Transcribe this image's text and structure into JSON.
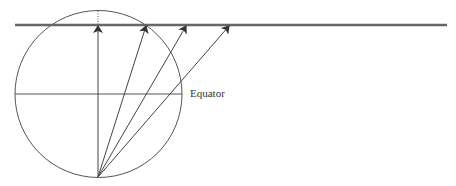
{
  "diagram": {
    "type": "geometry",
    "labels": {
      "equator": "Equator"
    },
    "colors": {
      "stroke": "#555555",
      "plane": "#666666",
      "text": "#333333"
    },
    "circle": {
      "cx": 98.5,
      "cy": 94,
      "r": 83.5
    },
    "plane_line": {
      "x1": 15,
      "x2": 447,
      "y": 25
    },
    "origin_point": {
      "x": 98,
      "y": 177
    },
    "arrow_targets": [
      {
        "x": 98,
        "y": 25
      },
      {
        "x": 146,
        "y": 25
      },
      {
        "x": 186,
        "y": 25
      },
      {
        "x": 229,
        "y": 25
      }
    ]
  }
}
